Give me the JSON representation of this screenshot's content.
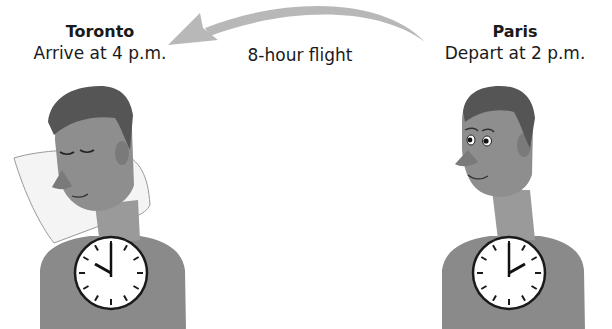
{
  "destination": {
    "city": "Toronto",
    "event": "Arrive at 4 p.m.",
    "clock": {
      "hour": 4,
      "minute": 0
    },
    "person_state": "sleeping"
  },
  "origin": {
    "city": "Paris",
    "event": "Depart at 2 p.m.",
    "clock": {
      "hour": 2,
      "minute": 0
    },
    "person_state": "awake"
  },
  "flight": {
    "label": "8-hour flight",
    "direction": "Paris to Toronto"
  },
  "colors": {
    "arrow": "#b8b8b8",
    "hair": "#555555",
    "skin": "#8e8e8e",
    "shirt": "#8a8a8a",
    "pillow": "#f4f4f4",
    "clock_face": "#ffffff",
    "clock_rim": "#1a1a1a"
  }
}
